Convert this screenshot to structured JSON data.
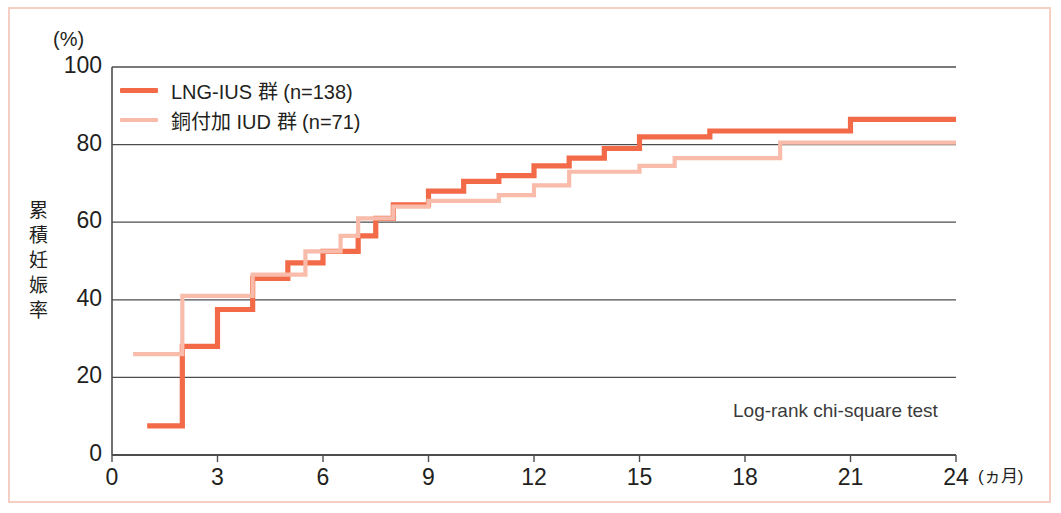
{
  "figure": {
    "y_unit_label": "(%)",
    "y_axis_title": "累積妊娠率",
    "x_unit_label": "(ヵ月)",
    "annotation": "Log-rank chi-square test",
    "frame_color": "#f6cfc4"
  },
  "legend": {
    "items": [
      {
        "label": "LNG-IUS 群 (n=138)",
        "color": "#f26a47"
      },
      {
        "label": "銅付加 IUD 群 (n=71)",
        "color": "#f9bcab"
      }
    ]
  },
  "chart_data": {
    "type": "line",
    "subtype": "step",
    "title": "",
    "xlabel": "(ヵ月)",
    "ylabel": "累積妊娠率",
    "yunit": "(%)",
    "xlim": [
      0,
      24
    ],
    "ylim": [
      0,
      100
    ],
    "xticks": [
      "0",
      "3",
      "6",
      "9",
      "12",
      "15",
      "18",
      "21",
      "24"
    ],
    "yticks": [
      "0",
      "20",
      "40",
      "60",
      "80",
      "100"
    ],
    "grid": "horizontal",
    "legend_position": "top-left",
    "annotations": [
      "Log-rank chi-square test"
    ],
    "series": [
      {
        "name": "LNG-IUS 群 (n=138)",
        "color": "#f26a47",
        "n": 138,
        "points": [
          {
            "x": 1,
            "y": 7.5
          },
          {
            "x": 2,
            "y": 28
          },
          {
            "x": 3,
            "y": 37.5
          },
          {
            "x": 4,
            "y": 45.5
          },
          {
            "x": 5,
            "y": 49.5
          },
          {
            "x": 6,
            "y": 52.5
          },
          {
            "x": 7,
            "y": 56.5
          },
          {
            "x": 7.5,
            "y": 61
          },
          {
            "x": 8,
            "y": 64.5
          },
          {
            "x": 9,
            "y": 68
          },
          {
            "x": 10,
            "y": 70.5
          },
          {
            "x": 11,
            "y": 72
          },
          {
            "x": 12,
            "y": 74.5
          },
          {
            "x": 13,
            "y": 76.5
          },
          {
            "x": 14,
            "y": 79
          },
          {
            "x": 15,
            "y": 82
          },
          {
            "x": 17,
            "y": 83.5
          },
          {
            "x": 21,
            "y": 86.5
          },
          {
            "x": 24,
            "y": 86.5
          }
        ]
      },
      {
        "name": "銅付加 IUD 群 (n=71)",
        "color": "#f9bcab",
        "n": 71,
        "points": [
          {
            "x": 0.6,
            "y": 26
          },
          {
            "x": 2,
            "y": 41
          },
          {
            "x": 3,
            "y": 41
          },
          {
            "x": 4,
            "y": 46.5
          },
          {
            "x": 5,
            "y": 46.5
          },
          {
            "x": 5.5,
            "y": 52.5
          },
          {
            "x": 6.5,
            "y": 56.5
          },
          {
            "x": 7,
            "y": 61
          },
          {
            "x": 8,
            "y": 64
          },
          {
            "x": 9,
            "y": 65.5
          },
          {
            "x": 11,
            "y": 67
          },
          {
            "x": 12,
            "y": 69.5
          },
          {
            "x": 13,
            "y": 73
          },
          {
            "x": 15,
            "y": 74.5
          },
          {
            "x": 16,
            "y": 76.5
          },
          {
            "x": 19,
            "y": 80.5
          },
          {
            "x": 24,
            "y": 80.5
          }
        ]
      }
    ]
  }
}
